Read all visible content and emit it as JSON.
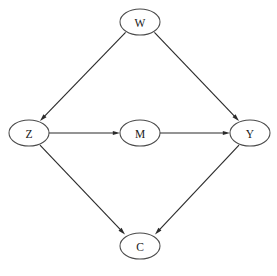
{
  "diagram": {
    "type": "dag",
    "background_color": "#ffffff",
    "node_fill": "#ffffff",
    "node_stroke": "#4a4a4a",
    "edge_color": "#2b2b2b",
    "label_color": "#1a1a1a",
    "canvas": {
      "width": 277,
      "height": 276
    },
    "node_shape": "ellipse",
    "node_rx": 20,
    "node_ry": 13,
    "nodes": [
      {
        "id": "W",
        "label": "W",
        "cx": 140,
        "cy": 22,
        "rx": 20,
        "ry": 13
      },
      {
        "id": "Z",
        "label": "Z",
        "cx": 29,
        "cy": 133,
        "rx": 20,
        "ry": 13
      },
      {
        "id": "M",
        "label": "M",
        "cx": 140,
        "cy": 133,
        "rx": 20,
        "ry": 13
      },
      {
        "id": "Y",
        "label": "Y",
        "cx": 250,
        "cy": 133,
        "rx": 20,
        "ry": 13
      },
      {
        "id": "C",
        "label": "C",
        "cx": 140,
        "cy": 246,
        "rx": 20,
        "ry": 13
      }
    ],
    "edges": [
      {
        "id": "W-Z",
        "from": "W",
        "to": "Z",
        "directed": true,
        "x1": 125.6,
        "y1": 32.3,
        "x2": 40.0,
        "y2": 120.9,
        "ax": 43.4,
        "ay": 117.4,
        "angle": 134.0
      },
      {
        "id": "W-Y",
        "from": "W",
        "to": "Y",
        "directed": true,
        "x1": 154.4,
        "y1": 32.3,
        "x2": 239.0,
        "y2": 120.9,
        "ax": 235.6,
        "ay": 117.4,
        "angle": 46.0
      },
      {
        "id": "Z-M",
        "from": "Z",
        "to": "M",
        "directed": true,
        "x1": 49.0,
        "y1": 133.0,
        "x2": 120.0,
        "y2": 133.0,
        "ax": 115.0,
        "ay": 133.0,
        "angle": 0.0
      },
      {
        "id": "M-Y",
        "from": "M",
        "to": "Y",
        "directed": true,
        "x1": 160.0,
        "y1": 133.0,
        "x2": 230.0,
        "y2": 133.0,
        "ax": 225.0,
        "ay": 133.0,
        "angle": 0.0
      },
      {
        "id": "Z-C",
        "from": "Z",
        "to": "C",
        "directed": true,
        "x1": 40.0,
        "y1": 145.1,
        "x2": 125.0,
        "y2": 234.4,
        "ax": 121.6,
        "ay": 230.8,
        "angle": 46.4
      },
      {
        "id": "Y-C",
        "from": "Y",
        "to": "C",
        "directed": true,
        "x1": 239.0,
        "y1": 145.1,
        "x2": 155.0,
        "y2": 234.4,
        "ax": 158.4,
        "ay": 230.8,
        "angle": 133.6
      }
    ]
  }
}
